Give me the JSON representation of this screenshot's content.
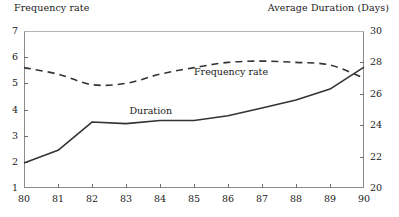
{
  "chart_data": {
    "type": "line",
    "title": "",
    "xlabel": "",
    "ylabel": "Frequency rate",
    "y2label": "Average Duration (Days)",
    "grid": false,
    "legend_position": "inline-annotations",
    "x": [
      80,
      81,
      82,
      83,
      84,
      85,
      86,
      87,
      88,
      89,
      90
    ],
    "xtick_labels": [
      "80",
      "81",
      "82",
      "83",
      "84",
      "85",
      "86",
      "87",
      "88",
      "89",
      "90"
    ],
    "xlim": [
      80,
      90
    ],
    "ylim": [
      1,
      7
    ],
    "ytick_labels": [
      "1",
      "2",
      "3",
      "4",
      "5",
      "6",
      "7"
    ],
    "ytick_values": [
      1,
      2,
      3,
      4,
      5,
      6,
      7
    ],
    "y2lim": [
      20,
      30
    ],
    "y2tick_labels": [
      "20",
      "22",
      "24",
      "26",
      "28",
      "30"
    ],
    "y2tick_values": [
      20,
      22,
      24,
      26,
      28,
      30
    ],
    "series": [
      {
        "name": "Frequency rate",
        "axis": "left",
        "style": "dashed",
        "color": "#333333",
        "label_x": 85.0,
        "label_y": 5.45,
        "values": [
          5.6,
          5.35,
          4.95,
          5.0,
          5.35,
          5.6,
          5.8,
          5.85,
          5.8,
          5.7,
          5.2
        ]
      },
      {
        "name": "Duration",
        "axis": "right",
        "style": "solid",
        "color": "#333333",
        "label_x": 83.1,
        "label_y": 3.95,
        "values": [
          21.6,
          22.4,
          24.2,
          24.1,
          24.3,
          24.3,
          24.6,
          25.1,
          25.6,
          26.3,
          27.7
        ]
      }
    ],
    "annotations": [
      {
        "text": "Frequency rate",
        "x": 85.0,
        "y_left": 5.45
      },
      {
        "text": "Duration",
        "x": 83.1,
        "y_left": 3.95
      }
    ]
  }
}
